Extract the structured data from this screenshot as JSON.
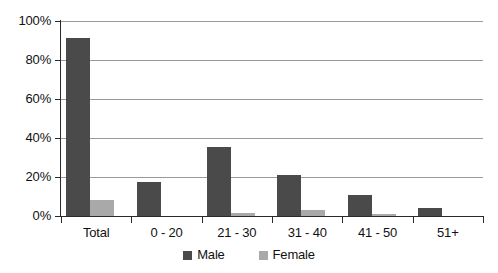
{
  "chart_data": {
    "type": "bar",
    "title": "",
    "subtitle": "",
    "xlabel": "",
    "ylabel": "",
    "categories": [
      "Total",
      "0 - 20",
      "21 - 30",
      "31 - 40",
      "41 - 50",
      "51+"
    ],
    "series": [
      {
        "name": "Male",
        "color": "#4a4a4a",
        "values": [
          91.5,
          17.5,
          35.5,
          21.0,
          11.0,
          4.0
        ]
      },
      {
        "name": "Female",
        "color": "#a9a9a9",
        "values": [
          8.0,
          0.0,
          1.5,
          3.0,
          1.0,
          0.0
        ]
      }
    ],
    "ylim": [
      0,
      100
    ],
    "ytick_values": [
      0,
      20,
      40,
      60,
      80,
      100
    ],
    "ytick_labels": [
      "0%",
      "20%",
      "40%",
      "60%",
      "80%",
      "100%"
    ],
    "grid": true,
    "grid_axis": "y",
    "legend_position": "bottom-center",
    "value_format": "percent"
  },
  "legend": {
    "items": [
      {
        "label": "Male",
        "swatch": "male-swatch"
      },
      {
        "label": "Female",
        "swatch": "female-swatch"
      }
    ]
  }
}
